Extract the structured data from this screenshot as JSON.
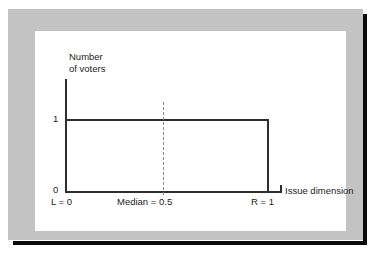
{
  "figure": {
    "frame_color": "#c3c3c3",
    "canvas_color": "#ffffff",
    "shadow_color": "#0a0a0a",
    "line_color": "#2e2e2e",
    "median_line_color": "#8a8a8a"
  },
  "chart_data": {
    "type": "area",
    "title": "",
    "subtitle": "",
    "xlabel": "Issue dimension",
    "ylabel_lines": [
      "Number",
      "of voters"
    ],
    "ylabel": "Number of voters",
    "xlim": [
      0,
      1
    ],
    "ylim": [
      0,
      1
    ],
    "grid": false,
    "legend": null,
    "x_tick_labels": [
      "L = 0",
      "Median = 0.5",
      "R = 1"
    ],
    "x_tick_values": [
      0,
      0.5,
      1
    ],
    "y_tick_labels": [
      "0",
      "1"
    ],
    "y_tick_values": [
      0,
      1
    ],
    "series": [
      {
        "name": "Voter distribution",
        "description": "Uniform density of voters across the issue dimension",
        "x": [
          0,
          1
        ],
        "values": [
          1,
          1
        ]
      }
    ],
    "annotations": [
      {
        "name": "median-line",
        "label": "Median = 0.5",
        "x": 0.5,
        "style": "dashed-vertical"
      }
    ]
  },
  "labels": {
    "y_title_line1": "Number",
    "y_title_line2": "of voters",
    "y_tick_one": "1",
    "y_tick_zero": "0",
    "x_left": "L = 0",
    "x_median": "Median = 0.5",
    "x_right": "R = 1",
    "x_title": "Issue dimension"
  }
}
